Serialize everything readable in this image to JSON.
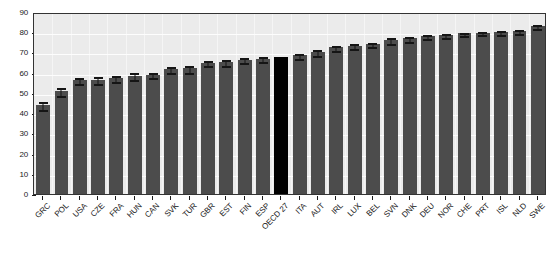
{
  "chart_data": {
    "type": "bar",
    "title": "",
    "subtitle": "",
    "xlabel": "",
    "ylabel": "",
    "ylim": [
      0,
      90
    ],
    "ytick_values": [
      0,
      10,
      20,
      30,
      40,
      50,
      60,
      70,
      80,
      90
    ],
    "ytick_labels": [
      "0",
      "10",
      "20",
      "30",
      "40",
      "50",
      "60",
      "70",
      "80",
      "90"
    ],
    "grid": true,
    "legend": "none",
    "highlight_category": "OECD 27",
    "colors": {
      "bar": "#4c4c4c",
      "highlight_bar": "#000000",
      "plot_background": "#ebebeb",
      "gridline": "#fdfdfd",
      "axis": "#333333",
      "error_bar": "#151515",
      "text": "#1a1a1a"
    },
    "categories": [
      "GRC",
      "POL",
      "USA",
      "CZE",
      "FRA",
      "HUN",
      "CAN",
      "SVK",
      "TUR",
      "GBR",
      "EST",
      "FIN",
      "ESP",
      "OECD 27",
      "ITA",
      "AUT",
      "IRL",
      "LUX",
      "BEL",
      "SVN",
      "DNK",
      "DEU",
      "NOR",
      "CHE",
      "PRT",
      "ISL",
      "NLD",
      "SWE"
    ],
    "values": [
      44.0,
      51.0,
      56.2,
      56.4,
      57.2,
      58.6,
      59.0,
      61.8,
      62.2,
      65.0,
      65.4,
      66.4,
      67.0,
      68.0,
      68.6,
      70.2,
      72.6,
      73.4,
      74.2,
      76.2,
      77.0,
      78.2,
      78.6,
      79.4,
      79.8,
      80.2,
      80.6,
      83.0
    ],
    "error_low": [
      41.6,
      48.4,
      54.2,
      54.2,
      55.2,
      56.4,
      57.2,
      59.6,
      60.0,
      63.2,
      63.4,
      64.6,
      65.2,
      null,
      67.0,
      68.4,
      70.8,
      71.6,
      72.6,
      74.4,
      75.4,
      76.6,
      77.2,
      78.0,
      78.4,
      78.8,
      79.2,
      81.4
    ],
    "error_high": [
      46.4,
      53.6,
      58.2,
      58.6,
      59.2,
      60.8,
      60.8,
      64.0,
      64.4,
      66.8,
      67.4,
      68.2,
      68.8,
      null,
      70.2,
      72.0,
      74.4,
      75.2,
      75.8,
      78.0,
      78.6,
      79.8,
      80.0,
      80.8,
      81.2,
      81.6,
      82.0,
      84.6
    ]
  }
}
